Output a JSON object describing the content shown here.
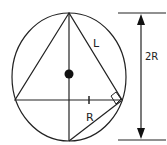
{
  "diagram": {
    "labels": {
      "side": "L",
      "radius": "R",
      "diameter": "2R"
    },
    "colors": {
      "stroke": "#222222",
      "background": "#ffffff"
    }
  }
}
